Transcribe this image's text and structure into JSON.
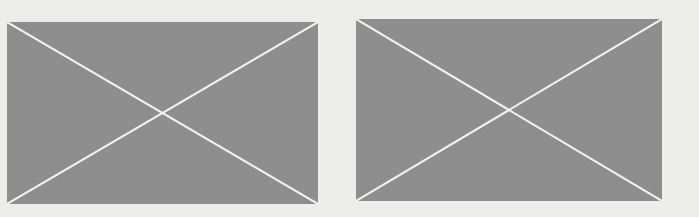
{
  "placeholders": [
    {
      "id": "placeholder-image-1",
      "label": "",
      "fill": "#8e8e8e",
      "line": "#f2f2f2"
    },
    {
      "id": "placeholder-image-2",
      "label": "",
      "fill": "#8e8e8e",
      "line": "#f2f2f2"
    }
  ],
  "colors": {
    "background": "#ededeb",
    "placeholder_fill": "#8e8e8e",
    "cross_line": "#f2f2f2"
  }
}
